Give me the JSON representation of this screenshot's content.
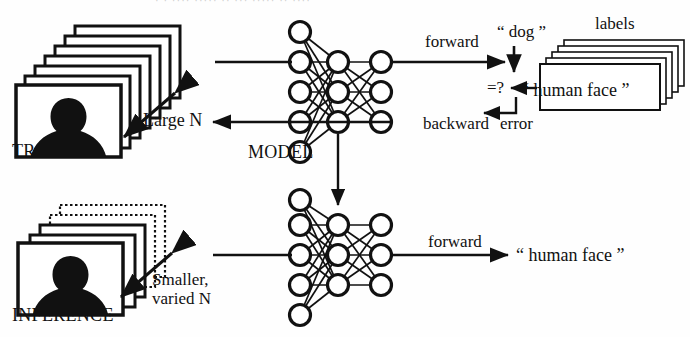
{
  "diagram": {
    "background_color": "#ffffff",
    "ink_color": "#111111"
  },
  "top_row": {
    "dataset_label": "TRAINING",
    "dataset_size_label": "Large N",
    "dataset_stack_count": 7,
    "model_label": "MODEL",
    "forward_label": "forward",
    "prediction_text": "“ dog ”",
    "compare_text": "=?",
    "backward_label": "backward",
    "error_label": "error",
    "labels_stack_title": "labels",
    "ground_truth_text": "“ human face ”",
    "labels_stack_count": 5
  },
  "bottom_row": {
    "dataset_label": "INFERENCE",
    "dataset_size_label_line1": "Smaller,",
    "dataset_size_label_line2": "varied N",
    "dataset_stack_count": 5,
    "forward_label": "forward",
    "prediction_text": "“ human face ”"
  },
  "network": {
    "layer_node_counts": [
      5,
      3,
      3
    ],
    "node_radius": 10,
    "stroke_width": 3
  },
  "scan_artifact": {
    "top_text": "· · ···· ····· ·· ··· ····· ·· ····"
  }
}
